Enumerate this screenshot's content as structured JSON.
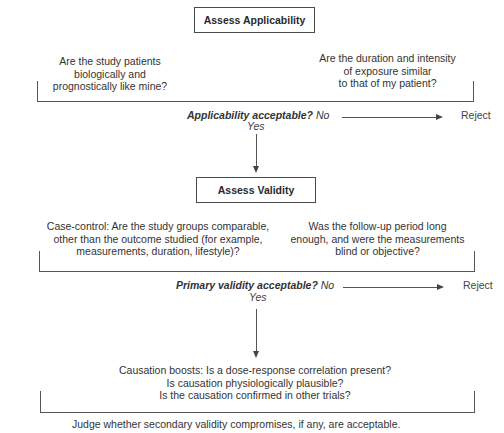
{
  "step1": {
    "title": "Assess Applicability",
    "question_left": "Are the study patients\nbiologically and\nprognostically like mine?",
    "question_right": "Are the duration and intensity\nof exposure similar\nto that of my patient?",
    "decision": "Applicability acceptable?",
    "no_label": "No",
    "yes_label": "Yes",
    "reject_label": "Reject"
  },
  "step2": {
    "title": "Assess Validity",
    "question_left": "Case-control: Are the study groups comparable,\nother than the outcome studied (for example,\nmeasurements, duration, lifestyle)?",
    "question_right": "Was the follow-up period long\nenough, and were the measurements\nblind or objective?",
    "decision": "Primary validity acceptable?",
    "no_label": "No",
    "yes_label": "Yes",
    "reject_label": "Reject"
  },
  "step3": {
    "causation_text": "Causation boosts: Is a dose-response correlation present?\nIs causation physiologically plausible?\nIs the causation confirmed in other trials?",
    "conclusion": "Judge whether secondary validity compromises, if any, are acceptable."
  }
}
